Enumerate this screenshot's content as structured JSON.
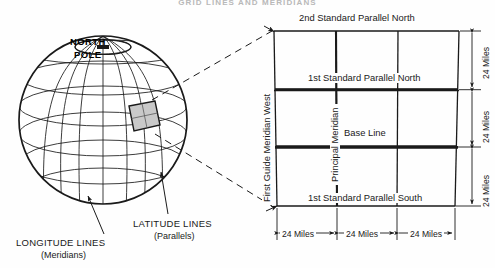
{
  "figure": {
    "title": "GRID LINES AND MERIDIANS",
    "background_color": "#fefefe",
    "ink_color": "#1a1a1a"
  },
  "globe": {
    "pole_label_line1": "NORTH",
    "pole_label_line2": "POLE",
    "shaded_patch": {
      "name": "quadrangle-patch",
      "fill_color": "#c9c9c9"
    }
  },
  "legend": {
    "latitude": {
      "title": "LATITUDE LINES",
      "subtitle": "(Parallels)"
    },
    "longitude": {
      "title": "LONGITUDE LINES",
      "subtitle": "(Meridians)"
    }
  },
  "grid": {
    "columns": 3,
    "rows": 3,
    "horizontal_lines": [
      "2nd Standard Parallel North",
      "1st Standard Parallel North",
      "Base Line",
      "1st Standard Parallel South"
    ],
    "vertical_lines": [
      "First Guide Meridian West",
      "Principal Meridian"
    ],
    "labels": {
      "second_standard_parallel_north": "2nd Standard Parallel North",
      "first_standard_parallel_north": "1st Standard Parallel North",
      "base_line": "Base Line",
      "first_standard_parallel_south": "1st Standard Parallel South",
      "first_guide_meridian_west": "First Guide Meridian West",
      "principal_meridian": "Principal Meridian"
    }
  },
  "dimensions": {
    "bottom": [
      "24 Miles",
      "24 Miles",
      "24 Miles"
    ],
    "right": [
      "24 Miles",
      "24 Miles",
      "24 Miles"
    ]
  }
}
